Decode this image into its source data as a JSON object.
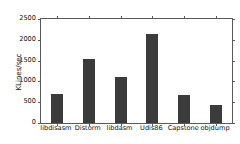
{
  "chart_data": {
    "type": "bar",
    "title": "",
    "xlabel": "",
    "ylabel": "KLines/sec",
    "categories": [
      "libdisasm",
      "Distorm",
      "libdasm",
      "Udis86",
      "Capstone",
      "objdump"
    ],
    "values": [
      690,
      1550,
      1110,
      2140,
      670,
      430
    ],
    "ylim": [
      0,
      2500
    ],
    "yticks": [
      0,
      500,
      1000,
      1500,
      2000,
      2500
    ],
    "ytick_labels": [
      "0",
      "500",
      "1000",
      "1500",
      "2000",
      "2500"
    ],
    "grid": false,
    "legend": null,
    "bar_color": "#3b3b3b",
    "axis_color": "#5a5a5a",
    "background_color": "#ffffff"
  }
}
